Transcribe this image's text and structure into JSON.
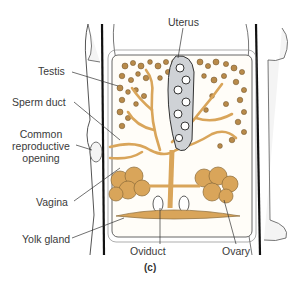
{
  "figure": {
    "panel_label": "(c)",
    "colors": {
      "organ_fill": "#d9a55a",
      "organ_stroke": "#8a6a3a",
      "testis_dot": "#b88a4a",
      "body_wall": "#f2f2f2",
      "outline": "#333333",
      "nerve_cord": "#111111",
      "uterus_fill": "#cfd2d6"
    }
  },
  "labels": [
    {
      "id": "uterus",
      "text": "Uterus"
    },
    {
      "id": "testis",
      "text": "Testis"
    },
    {
      "id": "sperm_duct",
      "text": "Sperm duct"
    },
    {
      "id": "common_reproductive_opening",
      "lines": [
        "Common",
        "reproductive",
        "opening"
      ]
    },
    {
      "id": "vagina",
      "text": "Vagina"
    },
    {
      "id": "yolk_gland",
      "text": "Yolk gland"
    },
    {
      "id": "oviduct",
      "text": "Oviduct"
    },
    {
      "id": "ovary",
      "text": "Ovary"
    }
  ]
}
